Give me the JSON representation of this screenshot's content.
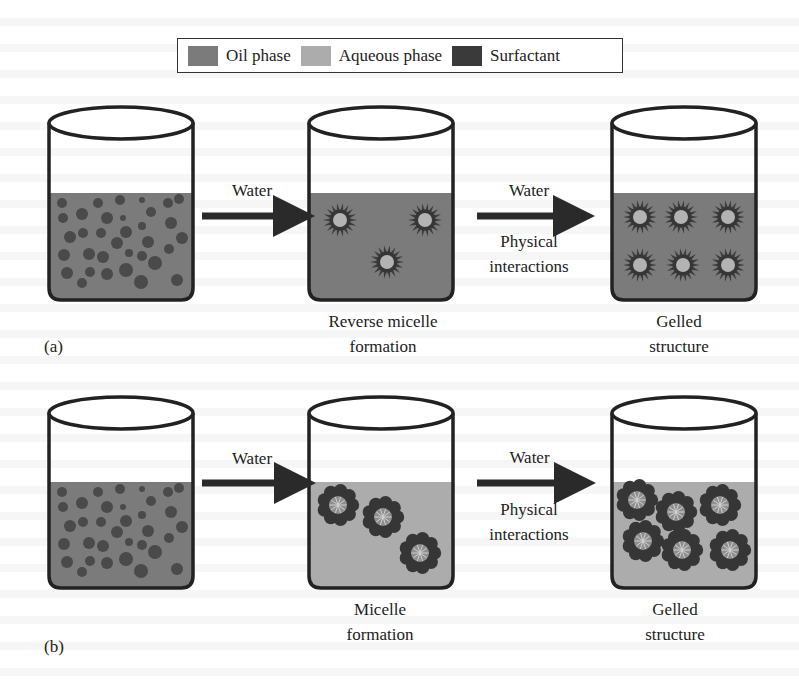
{
  "legend": {
    "items": [
      {
        "label": "Oil phase",
        "color": "#7b7b7b"
      },
      {
        "label": "Aqueous phase",
        "color": "#acacac"
      },
      {
        "label": "Surfactant",
        "color": "#3a3a3a"
      }
    ]
  },
  "colors": {
    "oil": "#7b7b7b",
    "aqueous": "#acacac",
    "surfactant": "#363636",
    "outline": "#222222",
    "arrow": "#2a2a2a",
    "reverse_core": "#b3b3b3",
    "micelle_core": "#8f8f8f"
  },
  "panels": [
    {
      "id": "a",
      "panel_label": "(a)",
      "beaker_top": 107,
      "liquid_top": 193,
      "beaker_bottom": 300,
      "steps": [
        {
          "id": "oil-dispersion",
          "x": 49,
          "liquid": "oil",
          "content": "droplets",
          "caption": []
        },
        {
          "id": "reverse-micelle",
          "x": 309,
          "liquid": "oil",
          "content": "reverse-micelles",
          "caption": [
            "Reverse micelle",
            "formation"
          ]
        },
        {
          "id": "gelled",
          "x": 612,
          "liquid": "oil",
          "content": "reverse-micelles",
          "caption": [
            "Gelled",
            "structure"
          ]
        }
      ],
      "arrows": [
        {
          "x1": 202,
          "x2": 301,
          "y": 216,
          "label_above": "Water",
          "label_below": []
        },
        {
          "x1": 477,
          "x2": 581,
          "y": 216,
          "label_above": "Water",
          "label_below": [
            "Physical",
            "interactions"
          ]
        }
      ],
      "particles": {
        "reverse-micelle": [
          [
            340,
            220
          ],
          [
            425,
            220
          ],
          [
            387,
            262
          ]
        ],
        "gelled": [
          [
            640,
            217
          ],
          [
            681,
            217
          ],
          [
            728,
            217
          ],
          [
            640,
            265
          ],
          [
            683,
            265
          ],
          [
            728,
            265
          ]
        ]
      }
    },
    {
      "id": "b",
      "panel_label": "(b)",
      "beaker_top": 397,
      "liquid_top": 482,
      "beaker_bottom": 588,
      "steps": [
        {
          "id": "oil-dispersion",
          "x": 49,
          "liquid": "oil",
          "content": "droplets",
          "caption": []
        },
        {
          "id": "micelle",
          "x": 309,
          "liquid": "aqueous",
          "content": "micelles",
          "caption": [
            "Micelle",
            "formation"
          ]
        },
        {
          "id": "gelled",
          "x": 612,
          "liquid": "aqueous",
          "content": "micelles",
          "caption": [
            "Gelled",
            "structure"
          ]
        }
      ],
      "arrows": [
        {
          "x1": 202,
          "x2": 302,
          "y": 483,
          "label_above": "Water",
          "label_below": []
        },
        {
          "x1": 477,
          "x2": 582,
          "y": 483,
          "label_above": "Water",
          "label_below": [
            "Physical",
            "interactions"
          ]
        }
      ],
      "particles": {
        "micelle": [
          [
            338,
            505
          ],
          [
            383,
            517
          ],
          [
            420,
            553
          ]
        ],
        "gelled": [
          [
            637,
            500
          ],
          [
            676,
            512
          ],
          [
            720,
            505
          ],
          [
            643,
            541
          ],
          [
            682,
            550
          ],
          [
            730,
            550
          ]
        ]
      }
    }
  ],
  "droplets": [
    [
      13,
      10,
      5
    ],
    [
      49,
      10,
      5
    ],
    [
      71,
      7,
      5
    ],
    [
      93,
      7,
      3
    ],
    [
      119,
      10,
      5
    ],
    [
      130,
      6,
      5
    ],
    [
      14,
      25,
      5
    ],
    [
      33,
      21,
      6
    ],
    [
      58,
      25,
      6
    ],
    [
      74,
      25,
      3
    ],
    [
      102,
      19,
      5
    ],
    [
      122,
      30,
      6
    ],
    [
      21,
      44,
      6
    ],
    [
      34,
      40,
      5
    ],
    [
      52,
      40,
      5
    ],
    [
      77,
      39,
      6
    ],
    [
      93,
      33,
      4
    ],
    [
      68,
      50,
      6
    ],
    [
      99,
      49,
      6
    ],
    [
      133,
      45,
      6
    ],
    [
      15,
      62,
      6
    ],
    [
      40,
      61,
      6
    ],
    [
      54,
      64,
      6
    ],
    [
      80,
      60,
      4
    ],
    [
      93,
      63,
      5
    ],
    [
      120,
      56,
      5
    ],
    [
      106,
      70,
      7
    ],
    [
      18,
      80,
      6
    ],
    [
      41,
      79,
      5
    ],
    [
      58,
      81,
      6
    ],
    [
      77,
      77,
      7
    ],
    [
      92,
      89,
      7
    ],
    [
      128,
      87,
      6
    ],
    [
      33,
      90,
      5
    ]
  ],
  "beaker_width": 144
}
